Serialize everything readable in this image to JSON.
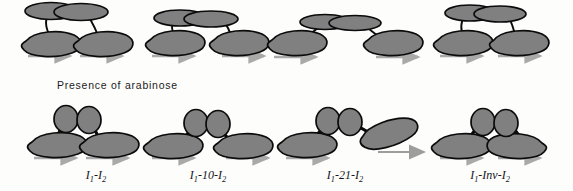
{
  "figure": {
    "type": "scientific-diagram",
    "background_color": "#fdfdfc",
    "shape_fill": "#808080",
    "shape_stroke": "#0b0b0b",
    "shadow_arrow_color": "#a9a9a9",
    "transition_arrow_color": "#9d9d9d"
  },
  "caption": {
    "arabinose_note": "Presence of arabinose"
  },
  "rows": {
    "top": {
      "name": "absence-of-arabinose-row",
      "protein_shape": "ellipse",
      "panels": [
        {
          "id": "top-1",
          "dimer_span": "narrow"
        },
        {
          "id": "top-2",
          "dimer_span": "medium"
        },
        {
          "id": "top-3",
          "dimer_span": "wide"
        },
        {
          "id": "top-4",
          "dimer_span": "narrow"
        }
      ]
    },
    "bottom": {
      "name": "presence-of-arabinose-row",
      "protein_shape": "circle",
      "panels": [
        {
          "id": "bottom-1",
          "label": "I1-I2",
          "label_main": "I",
          "operator_right": "normal"
        },
        {
          "id": "bottom-2",
          "label": "I1-10-I2",
          "spacer": "10",
          "operator_right": "normal"
        },
        {
          "id": "bottom-3",
          "label": "I1-21-I2",
          "spacer": "21",
          "operator_right": "tilted"
        },
        {
          "id": "bottom-4",
          "label": "I1-Inv-I2",
          "spacer": "Inv",
          "operator_right": "inverted"
        }
      ]
    }
  },
  "labels": [
    {
      "pre": "I",
      "sub1": "1",
      "mid": "-",
      "sub2": "2",
      "full": "I1-I2",
      "x": 96
    },
    {
      "pre": "I",
      "sub1": "1",
      "mid": "-10-",
      "sub2": "2",
      "full": "I1-10-I2",
      "x": 208
    },
    {
      "pre": "I",
      "sub1": "1",
      "mid": "-21-",
      "sub2": "2",
      "full": "I1-21-I2",
      "x": 345
    },
    {
      "pre": "I",
      "sub1": "1",
      "mid": "-Inv-",
      "sub2": "2",
      "full": "I1-Inv-I2",
      "x": 490
    }
  ],
  "transition_arrow": {
    "name": "conversion-arrow",
    "from_panel": "I1-21-I2",
    "to_panel": "I1-Inv-I2",
    "direction": "right"
  }
}
